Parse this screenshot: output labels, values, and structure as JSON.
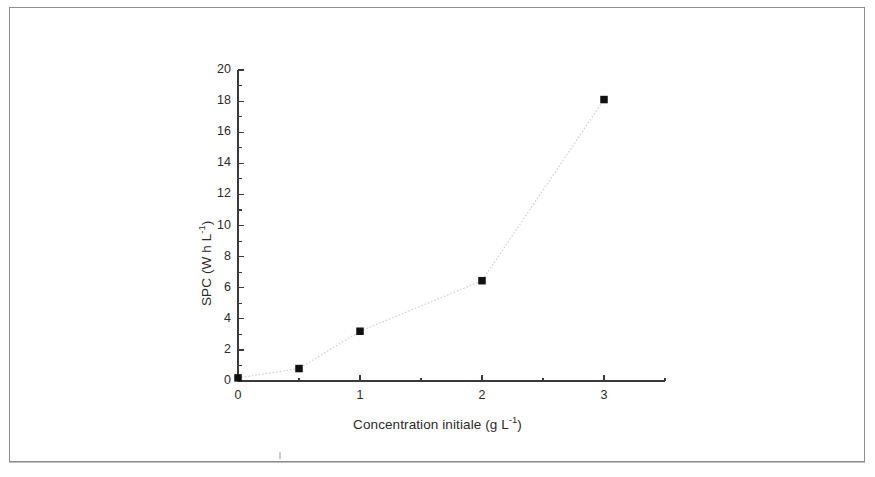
{
  "figure": {
    "background_color": "#ffffff",
    "axis_color": "#3a3a3a",
    "marker_color": "#111111",
    "line_color": "#cfcfcf",
    "frame_color": "#8e8e8e"
  },
  "chart_data": {
    "type": "scatter",
    "title": "",
    "subtitle": "",
    "xlabel": "Concentration initiale (g L-1)",
    "xlabel_base": "Concentration initiale (g L",
    "xlabel_sup": "-1",
    "xlabel_tail": ")",
    "ylabel": "SPC (W h L-1)",
    "ylabel_base": "SPC (W h L",
    "ylabel_sup": "-1",
    "ylabel_tail": ")",
    "x": [
      0,
      0.5,
      1,
      2,
      3
    ],
    "values": [
      0.2,
      0.8,
      3.2,
      6.45,
      18.1
    ],
    "series": [
      {
        "name": "SPC",
        "marker": "filled-square",
        "line_style": "dotted",
        "values": [
          0.2,
          0.8,
          3.2,
          6.45,
          18.1
        ]
      }
    ],
    "xlim": [
      0,
      3.5
    ],
    "ylim": [
      0,
      20
    ],
    "x_major_ticks": [
      0,
      1,
      2,
      3
    ],
    "x_minor_ticks": [
      0.5,
      1.5,
      2.5,
      3.5
    ],
    "x_tick_labels": [
      "0",
      "1",
      "2",
      "3"
    ],
    "y_major_ticks": [
      0,
      2,
      4,
      6,
      8,
      10,
      12,
      14,
      16,
      18,
      20
    ],
    "y_minor_ticks": [
      1,
      3,
      5,
      7,
      9,
      11,
      13,
      15,
      17,
      19
    ],
    "y_tick_labels": [
      "0",
      "2",
      "4",
      "6",
      "8",
      "10",
      "12",
      "14",
      "16",
      "18",
      "20"
    ],
    "grid": false,
    "legend": null,
    "legend_position": "none",
    "annotations": []
  }
}
